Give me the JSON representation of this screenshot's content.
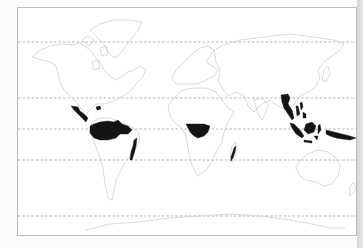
{
  "map": {
    "type": "world-distribution-map",
    "subject": "tropical rainforest distribution",
    "frame": {
      "x": 17,
      "y": 7,
      "width": 340,
      "height": 229,
      "border_color": "#bdbdbd"
    },
    "latitude_lines_y": [
      42,
      98,
      129,
      160,
      216
    ],
    "latitude_line_color": "#9a9a9a",
    "coastline_color": "#c8c8c8",
    "highlight_color": "#141414",
    "highlighted_regions": [
      {
        "name": "Central America"
      },
      {
        "name": "Amazon Basin"
      },
      {
        "name": "Atlantic Coast of Brazil"
      },
      {
        "name": "Congo Basin"
      },
      {
        "name": "Eastern Madagascar"
      },
      {
        "name": "Southeast Asia / Indochina"
      },
      {
        "name": "Malay Archipelago"
      },
      {
        "name": "Borneo"
      },
      {
        "name": "New Guinea"
      }
    ]
  }
}
